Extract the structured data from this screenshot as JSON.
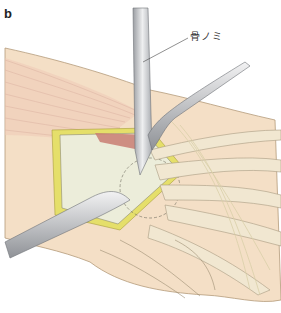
{
  "figure": {
    "panel_label": "b",
    "callouts": [
      {
        "text": "骨ノミ",
        "target": "osteotome"
      }
    ],
    "colors": {
      "skin": "#f3dcc0",
      "muscle": "#eec7b4",
      "tendon": "#f0e6cf",
      "bone": "#eeeedd",
      "fat": "#e6e26a",
      "instrument": "#c9c9cb",
      "line": "#8a7a66"
    }
  }
}
